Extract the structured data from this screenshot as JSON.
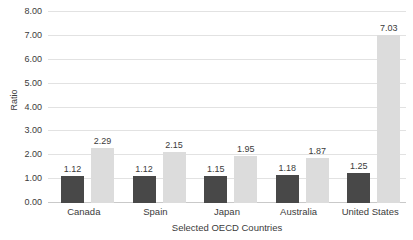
{
  "chart_data": {
    "type": "bar",
    "title": "",
    "subtitle": "",
    "xlabel": "Selected OECD Countries",
    "ylabel": "Ratio",
    "categories": [
      "Canada",
      "Spain",
      "Japan",
      "Australia",
      "United States"
    ],
    "series": [
      {
        "name": "series-1",
        "color": "#484848",
        "values": [
          1.12,
          1.12,
          1.15,
          1.18,
          1.25
        ],
        "labels": [
          "1.12",
          "1.12",
          "1.15",
          "1.18",
          "1.25"
        ]
      },
      {
        "name": "series-2",
        "color": "#dcdcdc",
        "values": [
          2.29,
          2.15,
          1.95,
          1.87,
          7.03
        ],
        "labels": [
          "2.29",
          "2.15",
          "1.95",
          "1.87",
          "7.03"
        ]
      }
    ],
    "ylim": [
      0,
      8
    ],
    "ytick_values": [
      0,
      1,
      2,
      3,
      4,
      5,
      6,
      7,
      8
    ],
    "ytick_labels": [
      "0.00",
      "1.00",
      "2.00",
      "3.00",
      "4.00",
      "5.00",
      "6.00",
      "7.00",
      "8.00"
    ],
    "grid": true,
    "grid_color": "#e2e2e2",
    "legend": false,
    "legend_position": "none",
    "background_color": "#ffffff",
    "data_labels_shown": true
  }
}
